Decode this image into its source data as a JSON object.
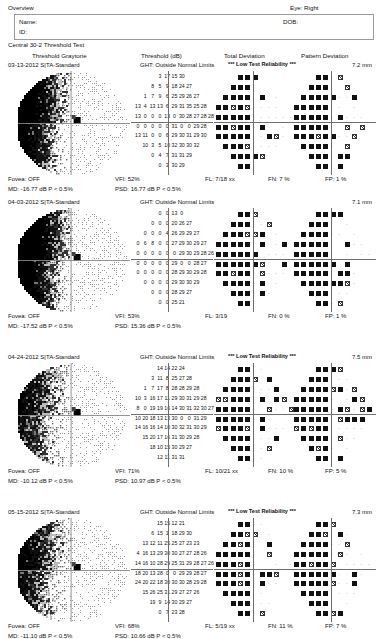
{
  "header": {
    "overview_label": "Overview",
    "eye_label": "Eye: Right",
    "name_label": "Name:",
    "id_label": "ID:",
    "dob_label": "DOB:",
    "test_title": "Central 30-2 Threshold Test"
  },
  "columns": {
    "graytone": "Threshold Graytone",
    "threshold": "Threshold (dB)",
    "total_deviation": "Total Deviation",
    "pattern_deviation": "Pattern Deviation"
  },
  "tests": [
    {
      "date": "03-13-2012",
      "strategy": "SITA-Standard",
      "ght": "GHT: Outside Normal Limits",
      "reliability": "*** Low Test Reliability ***",
      "foveal_mm": "7.2 mm",
      "fovea": "Fovea: OFF",
      "md": "MD: -16.77 dB P < 0.5%",
      "vfi": "VFI: 52%",
      "psd": "PSD: 16.77 dB P < 0.5%",
      "fl": "FL: 7/18 xx",
      "fn": "FN:  7 %",
      "fp": "FP:  1 %",
      "threshold_rows": [
        [
          null,
          null,
          null,
          "3",
          "17",
          "15",
          "30",
          null,
          null,
          null
        ],
        [
          null,
          null,
          "8",
          "5",
          "9",
          "18",
          "24",
          "27",
          null,
          null
        ],
        [
          null,
          "1",
          "7",
          "9",
          "6",
          "25",
          "29",
          "26",
          "27",
          null
        ],
        [
          "13",
          "4",
          "13",
          "13",
          "6",
          "29",
          "31",
          "35",
          "25",
          "28"
        ],
        [
          "13",
          "0",
          "0",
          "0",
          "13",
          "0",
          "30",
          "28",
          "27",
          "28",
          "28"
        ],
        [
          "0",
          "0",
          "0",
          "0",
          "0",
          "31",
          "0",
          "0",
          "29",
          "28"
        ],
        [
          "13",
          "11",
          "0",
          "0",
          "6",
          "29",
          "30",
          "31",
          "29",
          "30"
        ],
        [
          null,
          "10",
          "3",
          "5",
          "10",
          "32",
          "30",
          "30",
          "32",
          null
        ],
        [
          null,
          null,
          "0",
          "4",
          "7",
          "31",
          "31",
          "29",
          null,
          null
        ],
        [
          null,
          null,
          null,
          "0",
          "3",
          "30",
          "29",
          null,
          null,
          null
        ]
      ]
    },
    {
      "date": "04-03-2012",
      "strategy": "SITA-Standard",
      "ght": "GHT: Outside Normal Limits",
      "reliability": "",
      "foveal_mm": "7.1 mm",
      "fovea": "Fovea: OFF",
      "md": "MD: -17.52 dB P < 0.5%",
      "vfi": "VFI: 53%",
      "psd": "PSD: 15.36 dB P < 0.5%",
      "fl": "FL: 3/19",
      "fn": "FN:  0 %",
      "fp": "FP:  1 %",
      "threshold_rows": [
        [
          null,
          null,
          null,
          "0",
          "0",
          "13",
          "0",
          null,
          null,
          null
        ],
        [
          null,
          null,
          "0",
          "0",
          "0",
          "20",
          "26",
          "27",
          null,
          null
        ],
        [
          null,
          "0",
          "0",
          "0",
          "4",
          "26",
          "29",
          "29",
          "27",
          null
        ],
        [
          "0",
          "6",
          "8",
          "0",
          "0",
          "27",
          "29",
          "30",
          "29",
          "27"
        ],
        [
          "0",
          "0",
          "0",
          "0",
          "0",
          "0",
          "29",
          "30",
          "29",
          "28",
          "26"
        ],
        [
          "0",
          "0",
          "0",
          "0",
          "0",
          "29",
          "0",
          "0",
          "28",
          "27"
        ],
        [
          "0",
          "0",
          "0",
          "0",
          "0",
          "28",
          "29",
          "30",
          "29",
          "28"
        ],
        [
          null,
          "0",
          "0",
          "0",
          "0",
          "29",
          "30",
          "30",
          "29",
          null
        ],
        [
          null,
          null,
          "0",
          "0",
          "0",
          "28",
          "29",
          "27",
          null,
          null
        ],
        [
          null,
          null,
          null,
          "0",
          "0",
          "25",
          "21",
          null,
          null,
          null
        ]
      ]
    },
    {
      "date": "04-24-2012",
      "strategy": "SITA-Standard",
      "ght": "GHT: Outside Normal Limits",
      "reliability": "*** Low Test Reliability ***",
      "foveal_mm": "7.5 mm",
      "fovea": "Fovea: OFF",
      "md": "MD: -10.12 dB P < 0.5%",
      "vfi": "VFI: 71%",
      "psd": "PSD: 10.97 dB P < 0.5%",
      "fl": "FL: 10/21 xx",
      "fn": "FN:  10 %",
      "fp": "FP:  5 %",
      "threshold_rows": [
        [
          null,
          null,
          null,
          "14",
          "14",
          "22",
          "24",
          null,
          null,
          null
        ],
        [
          null,
          null,
          "3",
          "11",
          "8",
          "25",
          "27",
          "28",
          null,
          null
        ],
        [
          null,
          "1",
          "7",
          "17",
          "8",
          "28",
          "28",
          "29",
          "28",
          null
        ],
        [
          "10",
          "3",
          "16",
          "17",
          "11",
          "29",
          "30",
          "31",
          "29",
          "28"
        ],
        [
          "8",
          "0",
          "19",
          "19",
          "16",
          "14",
          "30",
          "31",
          "32",
          "30",
          "27"
        ],
        [
          "10",
          "20",
          "18",
          "13",
          "13",
          "30",
          "0",
          "0",
          "31",
          "29"
        ],
        [
          "14",
          "16",
          "16",
          "14",
          "10",
          "30",
          "32",
          "31",
          "30",
          "29"
        ],
        [
          null,
          "15",
          "20",
          "17",
          "16",
          "31",
          "30",
          "29",
          "28",
          null
        ],
        [
          null,
          null,
          "18",
          "10",
          "15",
          "30",
          "29",
          "27",
          null,
          null
        ],
        [
          null,
          null,
          null,
          "12",
          "11",
          "31",
          "31",
          null,
          null,
          null
        ]
      ]
    },
    {
      "date": "05-15-2012",
      "strategy": "SITA-Standard",
      "ght": "GHT: Outside Normal Limits",
      "reliability": "*** Low Test Reliability ***",
      "foveal_mm": "7.3 mm",
      "fovea": "Fovea: OFF",
      "md": "MD: -11.10 dB P < 0.5%",
      "vfi": "VFI: 68%",
      "psd": "PSD: 10.66 dB P < 0.5%",
      "fl": "FL: 5/19 xx",
      "fn": "FN:  11 %",
      "fp": "FP:  7 %",
      "threshold_rows": [
        [
          null,
          null,
          null,
          "15",
          "15",
          "12",
          "21",
          null,
          null,
          null
        ],
        [
          null,
          null,
          "6",
          "15",
          "1",
          "18",
          "29",
          "30",
          null,
          null
        ],
        [
          null,
          "13",
          "12",
          "11",
          "25",
          "25",
          "27",
          "23",
          "23",
          null
        ],
        [
          "4",
          "16",
          "13",
          "29",
          "30",
          "30",
          "27",
          "27",
          "28",
          "26"
        ],
        [
          "14",
          "16",
          "10",
          "28",
          "29",
          "25",
          "31",
          "29",
          "28",
          "27",
          "26"
        ],
        [
          "18",
          "20",
          "13",
          "28",
          "0",
          "0",
          "29",
          "29",
          "28",
          "27"
        ],
        [
          "24",
          "20",
          "22",
          "18",
          "30",
          "30",
          "30",
          "28",
          "29",
          "28"
        ],
        [
          null,
          "15",
          "26",
          "25",
          "31",
          "29",
          "27",
          "27",
          "26",
          null
        ],
        [
          null,
          null,
          "19",
          "9",
          "14",
          "30",
          "29",
          "27",
          null,
          null
        ],
        [
          null,
          null,
          null,
          "0",
          "7",
          "23",
          "28",
          null,
          null,
          null
        ]
      ]
    }
  ],
  "symbols": {
    "filled": "filled-black-square",
    "hatched": "hatched-square",
    "dotted": "dotted-square",
    "point": "small-dot"
  }
}
